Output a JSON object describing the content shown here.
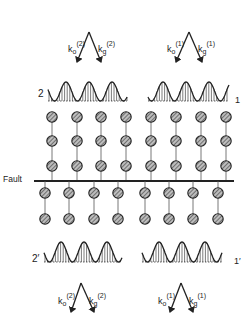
{
  "diagram": {
    "fault_label": "Fault",
    "top_beams": [
      {
        "id": "beam-2",
        "k0": "k",
        "k0_sub": "o",
        "k0_sup": "(2)",
        "kg": "k",
        "kg_sub": "g",
        "kg_sup": "(2)"
      },
      {
        "id": "beam-1",
        "k0": "k",
        "k0_sub": "o",
        "k0_sup": "(1)",
        "kg": "k",
        "kg_sub": "g",
        "kg_sup": "(1)"
      }
    ],
    "bottom_beams": [
      {
        "id": "beam-2p",
        "k0": "k",
        "k0_sub": "o",
        "k0_sup": "(2)",
        "kg": "k",
        "kg_sub": "g",
        "kg_sup": "(2)"
      },
      {
        "id": "beam-1p",
        "k0": "k",
        "k0_sub": "o",
        "k0_sup": "(1)",
        "kg": "k",
        "kg_sub": "g",
        "kg_sup": "(1)"
      }
    ],
    "wavefield_labels": {
      "top_left": "2",
      "top_right": "1",
      "bottom_left": "2′",
      "bottom_right": "1′"
    },
    "upper_crystal": {
      "columns_x": [
        52,
        77,
        101,
        126,
        151,
        176,
        201,
        226
      ],
      "rows_y": [
        117,
        141,
        166
      ]
    },
    "lower_crystal": {
      "columns_x": [
        45,
        69,
        94,
        118,
        145,
        169,
        193,
        218
      ],
      "rows_y": [
        193,
        219
      ]
    },
    "colors": {
      "ink": "#222222",
      "atom_fill": "#8a8a8a",
      "background": "#ffffff"
    }
  }
}
